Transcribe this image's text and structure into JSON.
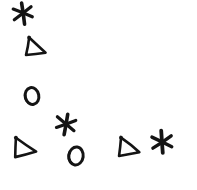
{
  "canvas": {
    "width": 197,
    "height": 190,
    "background_color": "#ffffff",
    "ink_color": "#141414",
    "description": "Hand-drawn black shapes scattered on a plain white background",
    "shape_count": 8
  },
  "legend": {
    "asterisk_count": 3,
    "triangle_count": 3,
    "circle_count": 2
  },
  "shapes": [
    {
      "id": "asterisk-1",
      "kind": "asterisk",
      "icon": "asterisk-icon",
      "label": "asterisk",
      "cx": 23,
      "cy": 13,
      "size": 21,
      "rotation": -8,
      "stroke": 3.2
    },
    {
      "id": "triangle-1",
      "kind": "triangle",
      "icon": "triangle-right-icon",
      "label": "triangle",
      "cx": 36,
      "cy": 48,
      "size": 20,
      "rotation": 14,
      "stroke": 2.6
    },
    {
      "id": "circle-1",
      "kind": "circle",
      "icon": "circle-outline-icon",
      "label": "circle",
      "cx": 32,
      "cy": 96,
      "size": 17,
      "rotation": -12,
      "stroke": 3.0
    },
    {
      "id": "asterisk-2",
      "kind": "asterisk",
      "icon": "asterisk-icon",
      "label": "asterisk",
      "cx": 66,
      "cy": 124,
      "size": 21,
      "rotation": 10,
      "stroke": 3.2
    },
    {
      "id": "triangle-2",
      "kind": "triangle",
      "icon": "triangle-right-icon",
      "label": "triangle",
      "cx": 25,
      "cy": 148,
      "size": 22,
      "rotation": 6,
      "stroke": 2.6
    },
    {
      "id": "circle-2",
      "kind": "circle",
      "icon": "circle-outline-icon",
      "label": "circle",
      "cx": 76,
      "cy": 156,
      "size": 18,
      "rotation": 8,
      "stroke": 3.0
    },
    {
      "id": "triangle-3",
      "kind": "triangle",
      "icon": "triangle-right-icon",
      "label": "triangle",
      "cx": 129,
      "cy": 148,
      "size": 21,
      "rotation": 10,
      "stroke": 2.6
    },
    {
      "id": "asterisk-3",
      "kind": "asterisk",
      "icon": "asterisk-icon",
      "label": "asterisk",
      "cx": 162,
      "cy": 142,
      "size": 23,
      "rotation": -4,
      "stroke": 3.4
    }
  ]
}
